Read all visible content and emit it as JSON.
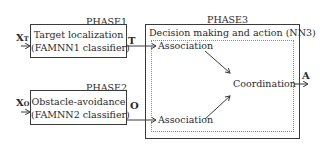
{
  "phase1": {
    "title": "PHASE1",
    "line1": "Target localization",
    "line2": "(FAMNN1 classifier)",
    "input_main": "X",
    "input_sub": "T",
    "output": "T"
  },
  "phase2": {
    "title": "PHASE2",
    "line1": "Obstacle-avoidance",
    "line2": "(FAMNN2 classifier)",
    "input_main": "X",
    "input_sub": "O",
    "output": "O"
  },
  "phase3": {
    "title": "PHASE3",
    "header": "Decision making and action (NN3)",
    "association_top": "Association",
    "association_bottom": "Association",
    "coordination": "Coordination",
    "output": "A"
  },
  "colors": {
    "line": "#3a3a3a",
    "dotted": "#8a8a8a",
    "text": "#2a2a2a"
  }
}
